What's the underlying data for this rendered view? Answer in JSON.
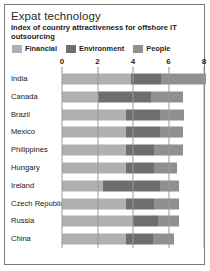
{
  "figure": {
    "title": "Expat technology",
    "subtitle": "Index of country attractiveness for offshore IT outsourcing"
  },
  "colors": {
    "financial": "#b0b0b0",
    "environment": "#6e6e6e",
    "people": "#909090",
    "gridline": "#9a9a9a",
    "border": "#7b7b7b",
    "text": "#1f1f1f"
  },
  "legend": {
    "position": "top",
    "entries": [
      {
        "label": "Financial",
        "color": "#b0b0b0",
        "swatch": "legend-swatch-financial"
      },
      {
        "label": "Environment",
        "color": "#6e6e6e",
        "swatch": "legend-swatch-environment"
      },
      {
        "label": "People",
        "color": "#909090",
        "swatch": "legend-swatch-people"
      }
    ]
  },
  "axis": {
    "ticks": [
      "0",
      "2",
      "4",
      "6",
      "8"
    ],
    "tick_values": [
      0,
      2,
      4,
      6,
      8
    ],
    "min": 0,
    "max": 8
  },
  "chart_data": {
    "type": "bar",
    "orientation": "horizontal",
    "stacked": true,
    "title": "Expat technology",
    "subtitle": "Index of country attractiveness for offshore IT outsourcing",
    "xlabel": "",
    "ylabel": "",
    "xlim": [
      0,
      8
    ],
    "grid": true,
    "legend_position": "top",
    "categories": [
      "India",
      "Canada",
      "Brazil",
      "Mexico",
      "Philippines",
      "Hungary",
      "Ireland",
      "Czech Republic",
      "Russia",
      "China"
    ],
    "series": [
      {
        "name": "Financial",
        "color": "#b0b0b0",
        "values": [
          3.9,
          2.0,
          3.6,
          3.6,
          3.6,
          3.6,
          2.3,
          3.6,
          4.0,
          3.6
        ]
      },
      {
        "name": "Environment",
        "color": "#6e6e6e",
        "values": [
          1.7,
          3.0,
          1.9,
          1.9,
          1.6,
          1.6,
          3.2,
          1.6,
          1.4,
          1.5
        ]
      },
      {
        "name": "People",
        "color": "#909090",
        "values": [
          2.5,
          1.8,
          1.4,
          1.3,
          1.6,
          1.3,
          1.1,
          1.4,
          1.2,
          1.2
        ]
      }
    ],
    "totals": [
      8.1,
      6.8,
      6.9,
      6.8,
      6.8,
      6.5,
      6.6,
      6.6,
      6.6,
      6.3
    ]
  }
}
